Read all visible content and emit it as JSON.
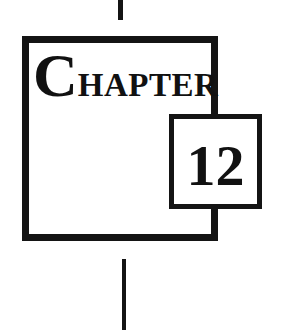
{
  "chapter_heading": {
    "initial": "C",
    "rest": "HAPTER",
    "number": "12"
  },
  "colors": {
    "ink": "#141414",
    "background": "#ffffff"
  }
}
